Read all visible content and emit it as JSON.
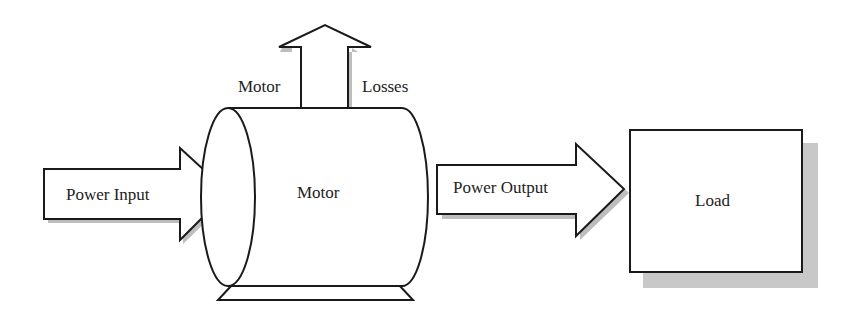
{
  "diagram": {
    "labels": {
      "power_input": "Power Input",
      "motor_body": "Motor",
      "motor_losses_left": "Motor",
      "motor_losses_right": "Losses",
      "power_output": "Power Output",
      "load": "Load"
    },
    "colors": {
      "stroke": "#1a1a1a",
      "shadow": "#bdbdbd",
      "fill": "#ffffff",
      "text": "#222222"
    }
  }
}
